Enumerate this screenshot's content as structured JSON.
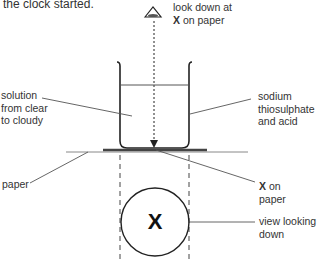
{
  "header_text": "the clock started.",
  "labels": {
    "look_down": {
      "line1": "look down at",
      "line2_bold": "X",
      "line2_rest": " on paper"
    },
    "solution": [
      "solution",
      "from clear",
      "to cloudy"
    ],
    "reagents": [
      "sodium",
      "thiosulphate",
      "and acid"
    ],
    "paper": "paper",
    "x_on_paper": {
      "line1_bold": "X",
      "line1_rest": " on",
      "line2": "paper"
    },
    "view": [
      "view looking",
      "down"
    ]
  },
  "circle_mark": "X",
  "icons": {
    "eye": "eye-icon",
    "arrow": "dotted-arrow-down"
  },
  "colors": {
    "line": "#222222",
    "leader": "#555555",
    "paper": "#888888",
    "x_band": "#444444"
  }
}
